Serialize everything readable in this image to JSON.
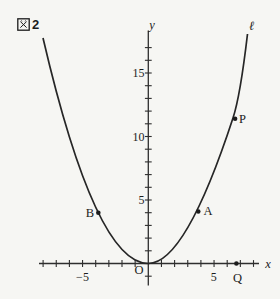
{
  "figure": {
    "label": "図2",
    "number": "2"
  },
  "colors": {
    "background": "#f6f6f3",
    "stroke": "#262626",
    "axis": "#2e2e2e",
    "text": "#1c1c1c"
  },
  "axes": {
    "x_label": "x",
    "y_label": "y",
    "origin_label": "O",
    "x_tick_labels": [
      "−5",
      "5"
    ],
    "y_tick_labels": [
      "15",
      "10",
      "5"
    ]
  },
  "labels": {
    "line": "ℓ",
    "A": "A",
    "B": "B",
    "P": "P",
    "Q": "Q"
  },
  "chart_data": {
    "type": "line",
    "curves": [
      {
        "name": "parabola",
        "equation_approx": "y ≈ 0.27x²",
        "x_range": [
          -8,
          8
        ],
        "description": "upward parabola with vertex at origin O"
      },
      {
        "name": "ℓ",
        "description": "steep line labeled ℓ coinciding with upper right branch, passing through A and P toward top right"
      }
    ],
    "points": [
      {
        "label": "O",
        "x": 0,
        "y": 0,
        "dot": false
      },
      {
        "label": "B",
        "x": -3.8,
        "y": 4,
        "dot": true
      },
      {
        "label": "A",
        "x": 3.8,
        "y": 4.1,
        "dot": true
      },
      {
        "label": "P",
        "x": 6.6,
        "y": 11.4,
        "dot": true
      },
      {
        "label": "Q",
        "x": 6.7,
        "y": 0,
        "dot": true
      }
    ],
    "x_axis": {
      "label": "x",
      "range": [
        -8.3,
        8.5
      ],
      "ticks_every": 1,
      "tick_range": [
        -8,
        8
      ],
      "labeled_ticks": [
        -5,
        5
      ]
    },
    "y_axis": {
      "label": "y",
      "range": [
        -1.7,
        18.4
      ],
      "ticks_every": 1,
      "tick_range": [
        -1,
        17
      ],
      "labeled_ticks": [
        5,
        10,
        15
      ]
    },
    "grid": false,
    "legend": false
  }
}
